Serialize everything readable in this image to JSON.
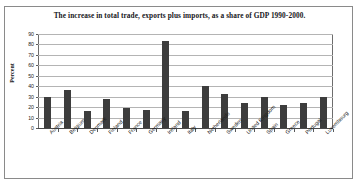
{
  "chart_data": {
    "type": "bar",
    "title": "The increase in total trade, exports plus imports, as a share of GDP 1990-2000.",
    "xlabel": "",
    "ylabel": "Percent",
    "ylim": [
      0,
      90
    ],
    "ytick_step": 10,
    "yticks": [
      90,
      80,
      70,
      60,
      50,
      40,
      30,
      20,
      10,
      0
    ],
    "grid": true,
    "legend": false,
    "bar_color": "#3d3d3d",
    "categories": [
      "Austria",
      "Belgium",
      "Denmark",
      "Finland",
      "France",
      "Germany",
      "Ireland",
      "Italy",
      "Netherlands",
      "Sweden",
      "United Kingdom",
      "Spain",
      "Greece",
      "Portugal",
      "Luxembourg"
    ],
    "values": [
      30,
      36,
      16,
      28,
      19,
      17,
      83,
      16,
      40,
      33,
      24,
      30,
      22,
      24,
      30
    ]
  }
}
